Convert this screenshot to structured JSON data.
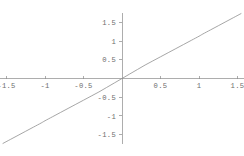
{
  "chart_data": {
    "type": "line",
    "title": "",
    "subtitle": "",
    "xlabel": "",
    "ylabel": "",
    "xlim": [
      -1.7,
      1.7
    ],
    "ylim": [
      -1.75,
      1.75
    ],
    "grid": false,
    "legend": null,
    "legend_position": "none",
    "x_ticks": [
      -1.5,
      -1,
      -0.5,
      0.5,
      1,
      1.5
    ],
    "x_tick_labels": [
      "-1.5",
      "-1",
      "-0.5",
      "0.5",
      "1",
      "1.5"
    ],
    "y_ticks": [
      -1.5,
      -1,
      -0.5,
      0.5,
      1,
      1.5
    ],
    "y_tick_labels": [
      "-1.5",
      "-1",
      "-0.5",
      "0.5",
      "1",
      "1.5"
    ],
    "axis_color": "#8a8a8a",
    "curve_color": "#8f8f8f",
    "background_color": "#ffffff",
    "series": [
      {
        "name": "curve",
        "x": [
          -1.55,
          -1.45,
          -1.35,
          -1.25,
          -1.15,
          -1.05,
          -1.0,
          -0.9,
          -0.8,
          -0.7,
          -0.6,
          -0.5,
          -0.4,
          -0.3,
          -0.2,
          -0.1,
          0.0,
          0.1,
          0.2,
          0.3,
          0.4,
          0.5,
          0.6,
          0.7,
          0.8,
          0.9,
          1.0,
          1.05,
          1.15,
          1.25,
          1.35,
          1.45,
          1.55
        ],
        "y": [
          -1.74,
          -1.63,
          -1.52,
          -1.41,
          -1.3,
          -1.19,
          -1.13,
          -1.02,
          -0.91,
          -0.8,
          -0.69,
          -0.58,
          -0.47,
          -0.36,
          -0.24,
          -0.12,
          0.0,
          0.12,
          0.24,
          0.36,
          0.47,
          0.58,
          0.69,
          0.8,
          0.91,
          1.02,
          1.13,
          1.19,
          1.3,
          1.41,
          1.52,
          1.63,
          1.74
        ]
      }
    ]
  },
  "axes": {
    "x_axis_name": "horizontal-axis",
    "y_axis_name": "vertical-axis"
  }
}
